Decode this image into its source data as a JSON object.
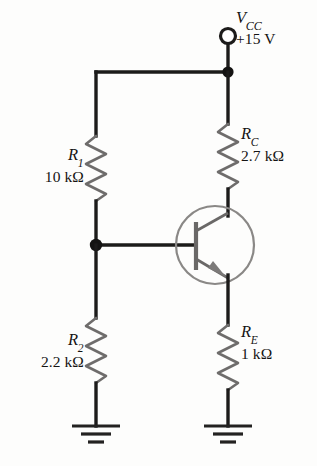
{
  "figure": {
    "name": "voltage-divider-biased-npn-transistor-circuit",
    "background_color": "#fdfdfc",
    "wire_color": "#1c1b1a",
    "resistor_color": "#6e6c6b",
    "transistor_color": "#8a8886"
  },
  "supply": {
    "symbol": "V",
    "subscript": "CC",
    "value": "+15 V",
    "terminal": "open-circle-terminal"
  },
  "components": {
    "r1": {
      "symbol": "R",
      "subscript": "1",
      "value": "10 kΩ",
      "type": "resistor"
    },
    "r2": {
      "symbol": "R",
      "subscript": "2",
      "value": "2.2 kΩ",
      "type": "resistor"
    },
    "rc": {
      "symbol": "R",
      "subscript": "C",
      "value": "2.7 kΩ",
      "type": "resistor"
    },
    "re": {
      "symbol": "R",
      "subscript": "E",
      "value": "1 kΩ",
      "type": "resistor"
    },
    "transistor": {
      "type": "npn-bipolar-junction-transistor",
      "terminals": [
        "collector",
        "base",
        "emitter"
      ]
    }
  },
  "nodes": {
    "supply_rail_junction": "junction-dot",
    "base_junction": "junction-dot"
  },
  "grounds": [
    {
      "name": "ground-left",
      "bars": 3
    },
    {
      "name": "ground-right",
      "bars": 3
    }
  ]
}
